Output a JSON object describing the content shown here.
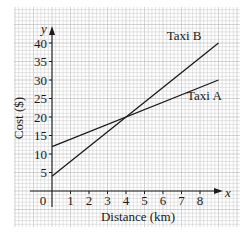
{
  "chart_data": {
    "type": "line",
    "title": "",
    "xlabel": "Distance (km)",
    "ylabel": "Cost ($)",
    "x_axis_symbol": "x",
    "y_axis_symbol": "y",
    "xlim": [
      0,
      9
    ],
    "ylim": [
      0,
      42
    ],
    "x_ticks": [
      1,
      2,
      3,
      4,
      5,
      6,
      7,
      8
    ],
    "y_ticks": [
      5,
      10,
      15,
      20,
      25,
      30,
      35,
      40
    ],
    "origin_label": "0",
    "grid": true,
    "legend": "inline labels",
    "series": [
      {
        "name": "Taxi A",
        "x": [
          0,
          9
        ],
        "y": [
          12,
          30
        ],
        "label_pos": [
          7.3,
          24.5
        ]
      },
      {
        "name": "Taxi B",
        "x": [
          0,
          9
        ],
        "y": [
          4,
          40
        ],
        "label_pos": [
          6.2,
          40.8
        ]
      }
    ],
    "intersection": {
      "x": 4,
      "y": 20
    },
    "colors": {
      "line": "#1a1a1a",
      "grid_minor": "#d0d0d0",
      "grid_major": "#b5b5b5",
      "background": "#ffffff"
    }
  }
}
